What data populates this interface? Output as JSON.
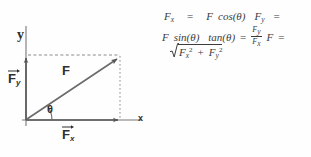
{
  "figure": {
    "kind": "force-vector-decomposition-diagram",
    "background_color": "#fefefe",
    "line_color": "#555555",
    "text_color": "#2e2e2e"
  },
  "diagram": {
    "axis_y_label": "y",
    "axis_x_label": "x",
    "resultant_label": "F",
    "angle_label": "θ",
    "component_y": {
      "symbol": "F",
      "subscript": "y",
      "has_vector_arrow": true
    },
    "component_x": {
      "symbol": "F",
      "subscript": "x",
      "has_vector_arrow": true
    },
    "origin": {
      "x": 26,
      "y": 120
    },
    "vector_tip": {
      "x": 120,
      "y": 56
    },
    "y_axis_top": {
      "x": 26,
      "y": 30
    },
    "x_axis_right": {
      "x": 136,
      "y": 120
    },
    "projection_lines": "dashed",
    "angle_arc_degrees": 34
  },
  "equations": {
    "line1": {
      "lhs1": "F",
      "lhs1_sub": "x",
      "eq1": "=",
      "rhs1": "F",
      "rhs1_fn": "cos(θ)",
      "lhs2": "F",
      "lhs2_sub": "y",
      "eq2": "="
    },
    "line2": {
      "rhs2": "F",
      "rhs2_fn": "sin(θ)",
      "tan_fn": "tan(θ)",
      "eq3": "=",
      "frac_num": "F",
      "frac_num_sub": "y",
      "frac_den": "F",
      "frac_den_sub": "x",
      "lhs3": "F",
      "eq4": "="
    },
    "line3": {
      "radical": "√",
      "term1": "F",
      "term1_sub": "x",
      "term1_sup": "2",
      "plus": "+",
      "term2": "F",
      "term2_sub": "y",
      "term2_sup": "2"
    },
    "plain_text": [
      "F_x = F cos(θ)   F_y =",
      "F sin(θ)  tan(θ) = F_y / F_x   F =",
      "√(F_x² + F_y²)"
    ]
  }
}
